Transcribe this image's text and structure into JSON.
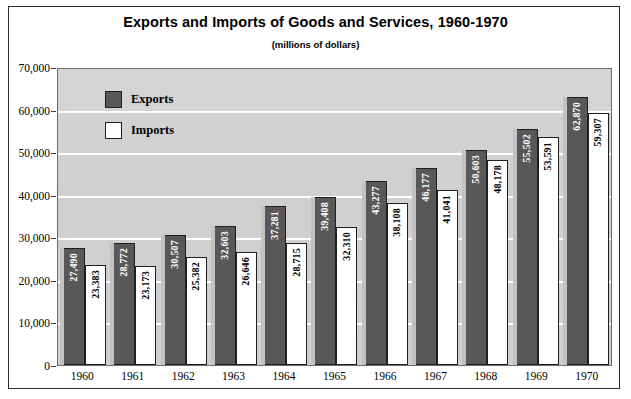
{
  "chart_data": {
    "type": "bar",
    "title": "Exports and Imports of Goods and Services, 1960-1970",
    "subtitle": "(millions of dollars)",
    "xlabel": "",
    "ylabel": "",
    "ylim": [
      0,
      70000
    ],
    "ytick_labels": [
      "70,000",
      "60,000",
      "50,000",
      "40,000",
      "30,000",
      "20,000",
      "10,000",
      "0"
    ],
    "ytick_values": [
      70000,
      60000,
      50000,
      40000,
      30000,
      20000,
      10000,
      0
    ],
    "grid": true,
    "legend_position": "inside-top-left",
    "categories": [
      "1960",
      "1961",
      "1962",
      "1963",
      "1964",
      "1965",
      "1966",
      "1967",
      "1968",
      "1969",
      "1970"
    ],
    "series": [
      {
        "name": "Exports",
        "color": "#585858",
        "values": [
          27490,
          28772,
          30507,
          32603,
          37281,
          39408,
          43277,
          46177,
          50603,
          55502,
          62870
        ],
        "labels": [
          "27,490",
          "28,772",
          "30,507",
          "32,603",
          "37,281",
          "39,408",
          "43,277",
          "46,177",
          "50,603",
          "55,502",
          "62,870"
        ]
      },
      {
        "name": "Imports",
        "color": "#ffffff",
        "values": [
          23383,
          23173,
          25382,
          26646,
          28715,
          32310,
          38108,
          41041,
          48178,
          53591,
          59307
        ],
        "labels": [
          "23,383",
          "23,173",
          "25,382",
          "26,646",
          "28,715",
          "32,310",
          "38,108",
          "41,041",
          "48,178",
          "53,591",
          "59,307"
        ]
      }
    ]
  },
  "legend": {
    "items": [
      {
        "label": "Exports",
        "color": "#585858"
      },
      {
        "label": "Imports",
        "color": "#ffffff"
      }
    ]
  },
  "colors": {
    "exports_bar": "#585858",
    "imports_bar": "#ffffff",
    "plot_background": "#d2d2d2",
    "gridline": "#ffffff",
    "frame": "#2b2b2b"
  }
}
